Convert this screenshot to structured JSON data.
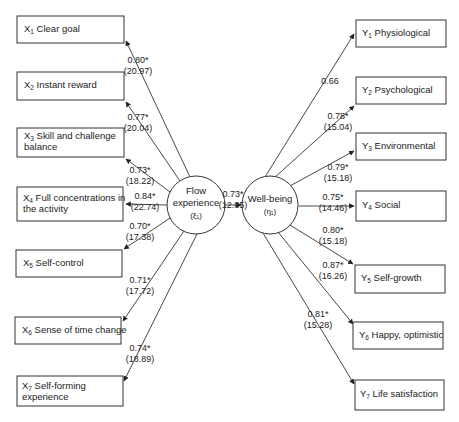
{
  "diagram": {
    "type": "structural equation model path diagram",
    "latent": {
      "flow": {
        "line1": "Flow",
        "line2": "experience",
        "symbol": "(ξ₁)"
      },
      "wellbeing": {
        "line1": "Well-being",
        "symbol": "(η₁)"
      }
    },
    "structural_path": {
      "coef": "0.73*",
      "t": "(12.85)"
    },
    "left_indicators": [
      {
        "var": "X",
        "sub": "1",
        "line1": "Clear goal",
        "line2": "",
        "coef": "0.80*",
        "t": "(20.97)"
      },
      {
        "var": "X",
        "sub": "2",
        "line1": "Instant reward",
        "line2": "",
        "coef": "0.77*",
        "t": "(20.04)"
      },
      {
        "var": "X",
        "sub": "3",
        "line1": "Skill and challenge",
        "line2": "balance",
        "coef": "0.73*",
        "t": "(18.22)"
      },
      {
        "var": "X",
        "sub": "4",
        "line1": "Full concentrations in",
        "line2": "the activity",
        "coef": "0.84*",
        "t": "(22.74)"
      },
      {
        "var": "X",
        "sub": "5",
        "line1": "Self-control",
        "line2": "",
        "coef": "0.70*",
        "t": "(17.38)"
      },
      {
        "var": "X",
        "sub": "6",
        "line1": "Sense of time change",
        "line2": "",
        "coef": "0.71*",
        "t": "(17.72)"
      },
      {
        "var": "X",
        "sub": "7",
        "line1": "Self-forming",
        "line2": "experience",
        "coef": "0.74*",
        "t": "(18.89)"
      }
    ],
    "right_indicators": [
      {
        "var": "Y",
        "sub": "1",
        "line1": "Physiological",
        "coef": "0.66",
        "t": ""
      },
      {
        "var": "Y",
        "sub": "2",
        "line1": "Psychological",
        "coef": "0.78*",
        "t": "(15.04)"
      },
      {
        "var": "Y",
        "sub": "3",
        "line1": "Environmental",
        "coef": "0.79*",
        "t": "(15.18)"
      },
      {
        "var": "Y",
        "sub": "4",
        "line1": "Social",
        "coef": "0.75*",
        "t": "(14.46)"
      },
      {
        "var": "Y",
        "sub": "5",
        "line1": "Self-growth",
        "coef": "0.80*",
        "t": "(15.18)"
      },
      {
        "var": "Y",
        "sub": "6",
        "line1": "Happy, optimistic",
        "coef": "0.87*",
        "t": "(16.26)"
      },
      {
        "var": "Y",
        "sub": "7",
        "line1": "Life satisfaction",
        "coef": "0.81*",
        "t": "(15.28)"
      }
    ]
  }
}
